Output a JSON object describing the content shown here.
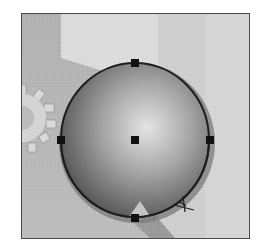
{
  "canvas": {
    "label": "Ellipse tool canvas",
    "frame": {
      "x": 21,
      "y": 13,
      "width": 229,
      "height": 226,
      "border_color": "#4a4a4a"
    },
    "background": {
      "base_color": "#b8b8b8",
      "light_panel_color": "#dcdcdc",
      "right_panel_color": "#cfcfcf",
      "bottom_wedge_color": "#9a9a9a"
    }
  },
  "shape": {
    "type": "ellipse",
    "selected": true,
    "center": {
      "x": 135,
      "y": 140
    },
    "radius_x": 74,
    "radius_y": 77,
    "gradient": {
      "highlight": "#e4e4e4",
      "mid": "#8e8e8e",
      "shadow": "#4f4f4f"
    },
    "outline_color": "#1e1e1e",
    "halo_color": "#7a7a7a"
  },
  "selection_handles": [
    {
      "name": "top",
      "x": 135,
      "y": 63
    },
    {
      "name": "left",
      "x": 61,
      "y": 140
    },
    {
      "name": "right",
      "x": 210,
      "y": 140
    },
    {
      "name": "bottom",
      "x": 135,
      "y": 218
    },
    {
      "name": "center",
      "x": 135,
      "y": 140
    }
  ],
  "handle_color": "#111111",
  "decorations": {
    "gear": {
      "x": 22,
      "y": 108,
      "color": "#d9d9d9"
    }
  },
  "cursor": {
    "type": "crosshair-pen",
    "x": 182,
    "y": 207,
    "color": "#1e1e1e"
  }
}
